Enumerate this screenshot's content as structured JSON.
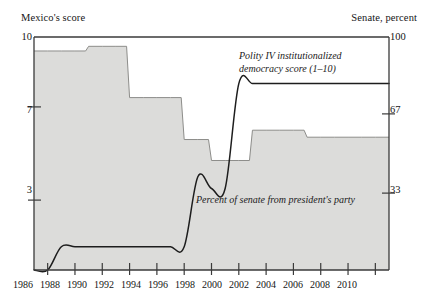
{
  "axes": {
    "left_caption": "Mexico's score",
    "right_caption": "Senate, percent",
    "left_ticks": [
      {
        "label": "10",
        "value": 10
      },
      {
        "label": "7",
        "value": 7
      },
      {
        "label": "3",
        "value": 3
      }
    ],
    "right_ticks": [
      {
        "label": "100",
        "value": 100
      },
      {
        "label": "67",
        "value": 67
      },
      {
        "label": "33",
        "value": 33
      }
    ],
    "x_ticks": [
      "1986",
      "1988",
      "1990",
      "1992",
      "1994",
      "1996",
      "1998",
      "2000",
      "2002",
      "2004",
      "2006",
      "2008",
      "2010"
    ]
  },
  "annotations": {
    "polity_line1": "Polity IV institutionalized",
    "polity_line2": "democracy score (1–10)",
    "senate_area": "Percent of senate from president's party"
  },
  "colors": {
    "area_fill": "#dcdcda",
    "area_stroke": "#8d8d8a",
    "line": "#1d1d1d",
    "axis": "#3a3a3a",
    "text": "#151515"
  },
  "chart_data": {
    "type": "area",
    "title": "",
    "subtitle": "",
    "xlabel": "",
    "ylabel": "Mexico's score",
    "y2label": "Senate, percent",
    "xlim": [
      1985,
      2011
    ],
    "ylim": [
      0,
      10
    ],
    "y2lim": [
      0,
      100
    ],
    "grid": false,
    "legend": "inline-annotations",
    "series": [
      {
        "name": "Percent of senate from president's party",
        "axis": "right",
        "type": "area-step",
        "units": "percent",
        "x": [
          1985,
          1986,
          1987,
          1988,
          1989,
          1990,
          1991,
          1992,
          1993,
          1994,
          1995,
          1996,
          1997,
          1998,
          1999,
          2000,
          2001,
          2002,
          2003,
          2004,
          2005,
          2006,
          2007,
          2008,
          2009,
          2010,
          2011
        ],
        "values": [
          94,
          94,
          94,
          94,
          96,
          96,
          96,
          74,
          74,
          74,
          74,
          56,
          56,
          47,
          47,
          47,
          60,
          60,
          60,
          60,
          57,
          57,
          57,
          57,
          57,
          57,
          57
        ]
      },
      {
        "name": "Polity IV institutionalized democracy score (1-10)",
        "axis": "left",
        "type": "line",
        "units": "score 1-10",
        "x": [
          1985,
          1986,
          1987,
          1988,
          1989,
          1990,
          1991,
          1992,
          1993,
          1994,
          1995,
          1996,
          1997,
          1998,
          1999,
          2000,
          2001,
          2002,
          2003,
          2004,
          2005,
          2006,
          2007,
          2008,
          2009,
          2010,
          2011
        ],
        "values": [
          0,
          0,
          1,
          1,
          1,
          1,
          1,
          1,
          1,
          1,
          1,
          1,
          4,
          3.5,
          3.5,
          8,
          8,
          8,
          8,
          8,
          8,
          8,
          8,
          8,
          8,
          8,
          8
        ]
      }
    ]
  }
}
